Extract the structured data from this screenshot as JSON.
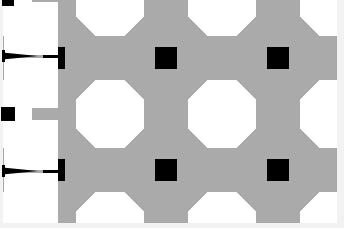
{
  "canvas": {
    "width": 344,
    "height": 228,
    "background_color": "#ffffff"
  },
  "palette": {
    "black": "#000000",
    "gray": "#aaaaaa",
    "white": "#ffffff",
    "edge_strip": "#f2f2f2"
  },
  "pattern": {
    "name": "overlapping-circles-tiling",
    "description": "Repeating quilt tiling of four overlapping black circles per cell forming petal lenses, over gray cell fields, with white octagon voids and solid black center squares.",
    "cell_size": 112,
    "origin_x": -2,
    "origin_y": 2,
    "columns": 4,
    "rows": 3,
    "circle_radius": 56,
    "center_square_size": 22,
    "corner_square_size": 22,
    "inner_white_half_diagonal": 34
  },
  "overlays": {
    "white_panels": [
      {
        "name": "upper-left-panel",
        "x": 4,
        "y": 2,
        "width": 54,
        "height": 53
      },
      {
        "name": "mid-left-panel",
        "x": 4,
        "y": 58,
        "width": 54,
        "height": 50
      },
      {
        "name": "lower-left-panel",
        "x": 4,
        "y": 120,
        "width": 54,
        "height": 50
      },
      {
        "name": "bottom-left-panel",
        "x": 4,
        "y": 173,
        "width": 54,
        "height": 53
      }
    ],
    "edge_strips": [
      {
        "name": "right-edge-strip",
        "x": 337,
        "y": 0,
        "width": 7,
        "height": 228
      },
      {
        "name": "bottom-edge-strip",
        "x": 0,
        "y": 223,
        "width": 344,
        "height": 5
      },
      {
        "name": "left-edge-strip",
        "x": 0,
        "y": 0,
        "width": 3,
        "height": 228
      }
    ],
    "marks": [
      {
        "name": "upper-arrow-mark",
        "x": 2,
        "y": 48,
        "width": 36,
        "height": 12
      },
      {
        "name": "mid-left-square-mark",
        "x": 1,
        "y": 107,
        "width": 14,
        "height": 14
      },
      {
        "name": "lower-arrow-mark",
        "x": 2,
        "y": 163,
        "width": 36,
        "height": 12
      },
      {
        "name": "top-left-notch-mark",
        "x": 2,
        "y": 0,
        "width": 12,
        "height": 6
      }
    ]
  },
  "meta": {
    "title": "Geometric Circle Tiling Pattern"
  }
}
